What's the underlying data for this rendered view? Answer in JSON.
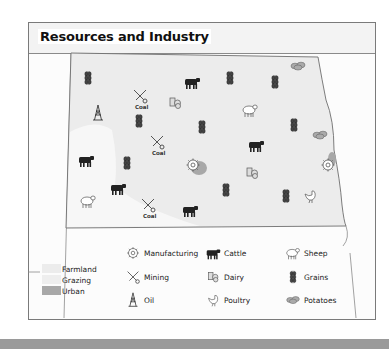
{
  "map": {
    "title": "Resources and Industry",
    "colors": {
      "farmland": "#ececec",
      "grazing": "#f6f6f6",
      "urban": "#a8a8a8",
      "border": "#6e6e6e",
      "icon_dark": "#222222"
    },
    "coal_label": "Coal",
    "symbols": [
      {
        "type": "grains",
        "x": 88,
        "y": 78
      },
      {
        "type": "mining-coal",
        "x": 140,
        "y": 96
      },
      {
        "type": "cattle",
        "x": 192,
        "y": 82
      },
      {
        "type": "grains",
        "x": 230,
        "y": 78
      },
      {
        "type": "grains",
        "x": 275,
        "y": 82
      },
      {
        "type": "potatoes",
        "x": 298,
        "y": 66
      },
      {
        "type": "dairy",
        "x": 175,
        "y": 103
      },
      {
        "type": "sheep",
        "x": 250,
        "y": 110
      },
      {
        "type": "oil",
        "x": 98,
        "y": 113
      },
      {
        "type": "grains",
        "x": 139,
        "y": 121
      },
      {
        "type": "grains",
        "x": 202,
        "y": 127
      },
      {
        "type": "grains",
        "x": 294,
        "y": 125
      },
      {
        "type": "mining-coal",
        "x": 157,
        "y": 142
      },
      {
        "type": "cattle",
        "x": 256,
        "y": 145
      },
      {
        "type": "potatoes",
        "x": 320,
        "y": 135
      },
      {
        "type": "cattle",
        "x": 86,
        "y": 160
      },
      {
        "type": "grains",
        "x": 127,
        "y": 163
      },
      {
        "type": "manufacturing",
        "x": 193,
        "y": 165
      },
      {
        "type": "manufacturing",
        "x": 328,
        "y": 165
      },
      {
        "type": "dairy",
        "x": 252,
        "y": 173
      },
      {
        "type": "cattle",
        "x": 118,
        "y": 188
      },
      {
        "type": "grains",
        "x": 226,
        "y": 190
      },
      {
        "type": "grains",
        "x": 286,
        "y": 196
      },
      {
        "type": "poultry",
        "x": 310,
        "y": 196
      },
      {
        "type": "sheep",
        "x": 88,
        "y": 201
      },
      {
        "type": "mining-coal",
        "x": 148,
        "y": 205
      },
      {
        "type": "cattle",
        "x": 190,
        "y": 210
      }
    ],
    "urban_areas": [
      {
        "x": 199,
        "y": 168,
        "rx": 8,
        "ry": 7
      },
      {
        "x": 332,
        "y": 159,
        "rx": 4,
        "ry": 7
      }
    ]
  },
  "legend": {
    "areas": [
      {
        "key": "farmland",
        "label": "Farmland"
      },
      {
        "key": "grazing",
        "label": "Grazing"
      },
      {
        "key": "urban",
        "label": "Urban"
      }
    ],
    "symbols": [
      {
        "icon": "manufacturing",
        "label": "Manufacturing"
      },
      {
        "icon": "cattle",
        "label": "Cattle"
      },
      {
        "icon": "sheep",
        "label": "Sheep"
      },
      {
        "icon": "mining",
        "label": "Mining"
      },
      {
        "icon": "dairy",
        "label": "Dairy"
      },
      {
        "icon": "grains",
        "label": "Grains"
      },
      {
        "icon": "oil",
        "label": "Oil"
      },
      {
        "icon": "poultry",
        "label": "Poultry"
      },
      {
        "icon": "potatoes",
        "label": "Potatoes"
      }
    ]
  }
}
